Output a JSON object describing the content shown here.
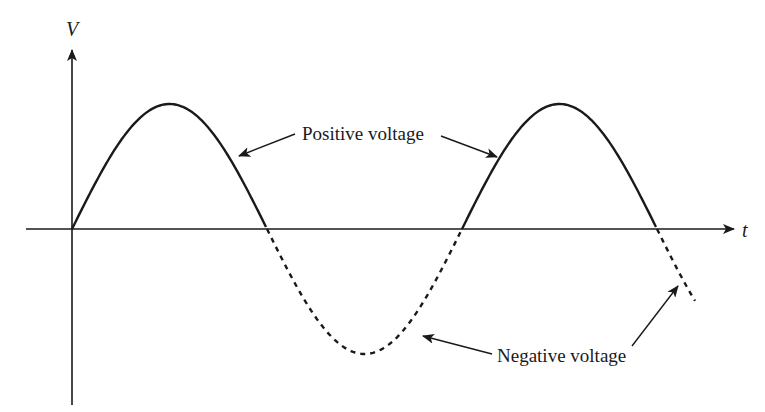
{
  "diagram": {
    "type": "sine-wave-voltage",
    "axes": {
      "y_label": "V",
      "x_label": "t"
    },
    "waveform": {
      "cycles_shown": 1.6,
      "positive_half_style": "solid",
      "negative_half_style": "dashed"
    },
    "annotations": {
      "positive": "Positive voltage",
      "negative": "Negative voltage"
    },
    "colors": {
      "ink": "#1a1a1a",
      "background": "#ffffff"
    }
  }
}
